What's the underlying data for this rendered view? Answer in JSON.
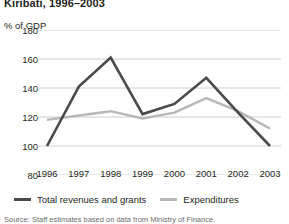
{
  "chart_data": {
    "type": "line",
    "title": "Kiribati, 1996–2003",
    "ylabel": "% of GDP",
    "xlabel": "",
    "categories": [
      "1996",
      "1997",
      "1998",
      "1999",
      "2000",
      "2001",
      "2002",
      "2003"
    ],
    "series": [
      {
        "name": "Total revenues and grants",
        "color": "#4a4a4a",
        "values": [
          100,
          141,
          161,
          122,
          129,
          147,
          123,
          100
        ]
      },
      {
        "name": "Expenditures",
        "color": "#b8b8b8",
        "values": [
          118,
          121,
          124,
          119,
          123,
          133,
          124,
          112
        ]
      }
    ],
    "ylim": [
      80,
      180
    ],
    "yticks": [
      "180",
      "160",
      "140",
      "120",
      "100",
      "80"
    ],
    "ytick_values": [
      180,
      160,
      140,
      120,
      100,
      80
    ],
    "grid": true,
    "legend_position": "bottom"
  },
  "legend": {
    "items": [
      {
        "label": "Total revenues and grants",
        "swatch": "dark"
      },
      {
        "label": "Expenditures",
        "swatch": "light"
      }
    ]
  },
  "source": {
    "text": "Source: Staff estimates based on data from Ministry of Finance."
  }
}
